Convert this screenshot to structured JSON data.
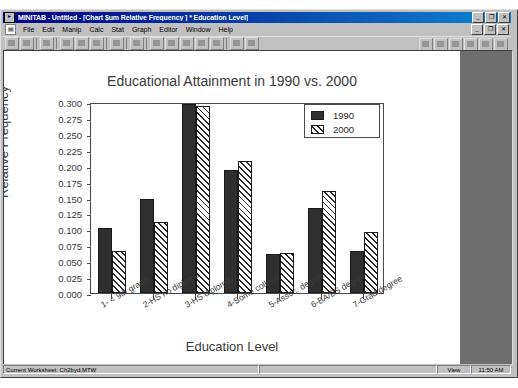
{
  "window": {
    "title": "MINITAB - Untitled - [Chart $um Relative Frequency ] * Education Level]",
    "app_icon": "minitab-icon",
    "minimize_label": "_",
    "restore_label": "❐",
    "close_label": "✕",
    "child_minimize_label": "_",
    "child_restore_label": "❐",
    "child_close_label": "✕"
  },
  "menubar": {
    "doc_icon": "document-icon",
    "items": [
      {
        "label": "File"
      },
      {
        "label": "Edit"
      },
      {
        "label": "Manip"
      },
      {
        "label": "Calc"
      },
      {
        "label": "Stat"
      },
      {
        "label": "Graph"
      },
      {
        "label": "Editor"
      },
      {
        "label": "Window"
      },
      {
        "label": "Help"
      }
    ]
  },
  "toolbar": {
    "buttons": [
      "open-worksheet-icon",
      "save-project-icon",
      "print-icon",
      "cut-icon",
      "copy-icon",
      "paste-icon",
      "undo-icon",
      "find-icon",
      "session-window-icon",
      "current-data-window-icon",
      "show-info-icon",
      "history-icon",
      "project-manager-icon",
      "cancel-icon",
      "help-pointer-icon"
    ],
    "right_buttons": [
      "graph-tool-icon",
      "graph-brush-icon",
      "graph-zoom-icon",
      "graph-pan-icon",
      "graph-select-icon",
      "graph-edit-icon"
    ]
  },
  "statusbar": {
    "worksheet_text": "Current Worksheet: Ch2byd.MTW",
    "middle_text": "",
    "mode_text": "View",
    "time_text": "11:50 AM"
  },
  "chart_data": {
    "type": "bar",
    "title": "Educational Attainment in 1990 vs. 2000",
    "xlabel": "Education Level",
    "ylabel": "Relative Frequency",
    "ylim": [
      0.0,
      0.3
    ],
    "ytick_step": 0.025,
    "ytick_labels": [
      "0.000",
      "0.025",
      "0.050",
      "0.075",
      "0.100",
      "0.125",
      "0.150",
      "0.175",
      "0.200",
      "0.225",
      "0.250",
      "0.275",
      "0.300"
    ],
    "grid": false,
    "legend_position": "top-right",
    "categories": [
      "1- < 9th grade",
      "2-HS no diploma",
      "3-HS diploma",
      "4-Some college",
      "5-Assoc. degree",
      "6-BA/BS degree",
      "7-Grad degree"
    ],
    "series": [
      {
        "name": "1990",
        "values": [
          0.102,
          0.148,
          0.297,
          0.193,
          0.062,
          0.134,
          0.066
        ]
      },
      {
        "name": "2000",
        "values": [
          0.066,
          0.112,
          0.294,
          0.208,
          0.063,
          0.161,
          0.096
        ]
      }
    ]
  }
}
